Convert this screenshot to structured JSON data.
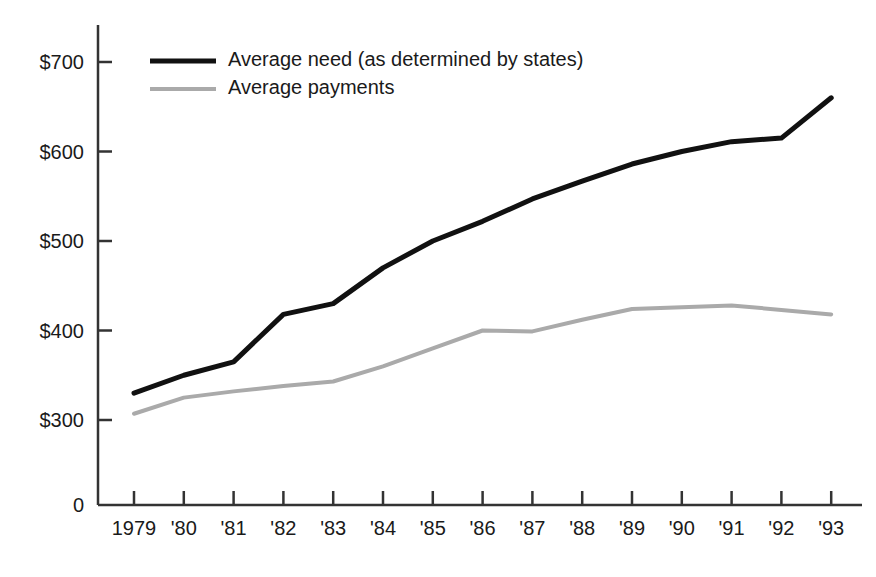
{
  "chart_data": {
    "type": "line",
    "title": "",
    "subtitle": "",
    "xlabel": "",
    "ylabel": "",
    "x": [
      "1979",
      "'80",
      "'81",
      "'82",
      "'83",
      "'84",
      "'85",
      "'86",
      "'87",
      "'88",
      "'89",
      "'90",
      "'91",
      "'92",
      "'93"
    ],
    "categories": [
      "1979",
      "'80",
      "'81",
      "'82",
      "'83",
      "'84",
      "'85",
      "'86",
      "'87",
      "'88",
      "'89",
      "'90",
      "'91",
      "'92",
      "'93"
    ],
    "series": [
      {
        "name": "Average need (as determined by states)",
        "color": "#111111",
        "line_width": 5,
        "values": [
          330,
          350,
          365,
          418,
          430,
          470,
          500,
          522,
          547,
          567,
          586,
          600,
          611,
          615,
          660
        ]
      },
      {
        "name": "Average payments",
        "color": "#aaaaaa",
        "line_width": 4,
        "values": [
          307,
          325,
          332,
          338,
          343,
          360,
          380,
          400,
          399,
          412,
          424,
          426,
          428,
          423,
          418
        ]
      }
    ],
    "ylim": [
      300,
      745
    ],
    "y_ticks": [
      300,
      400,
      500,
      600,
      700
    ],
    "y_tick_labels": [
      "$300",
      "$400",
      "$500",
      "$600",
      "$700"
    ],
    "y_zero_label": "0",
    "y_axis_break": true,
    "grid": false,
    "legend_position": "top-left",
    "legend": [
      {
        "label": "Average need (as determined by states)",
        "color": "#111111"
      },
      {
        "label": "Average payments",
        "color": "#aaaaaa"
      }
    ]
  },
  "axes": {
    "axis_color": "#333333",
    "background": "#ffffff"
  }
}
